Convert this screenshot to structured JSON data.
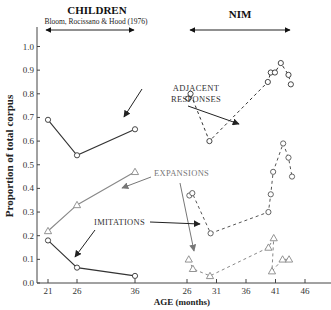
{
  "chart_data": {
    "type": "line",
    "title": "",
    "xlabel": "AGE (months)",
    "ylabel": "Proportion of total corpus",
    "ylim": [
      0.0,
      1.05
    ],
    "y_ticks": [
      "0.0",
      "0.1",
      "0.2",
      "0.3",
      "0.4",
      "0.5",
      "0.6",
      "0.7",
      "0.8",
      "0.9",
      "1.0"
    ],
    "grid": false,
    "groups": [
      {
        "name": "CHILDREN",
        "subtitle": "Bloom, Rocissano & Hood (1976)",
        "x_ticks": [
          "21",
          "26",
          "36"
        ],
        "line_style": "solid",
        "series": [
          {
            "name": "ADJACENT RESPONSES",
            "marker": "circle",
            "color": "#333333",
            "x": [
              21,
              26,
              36
            ],
            "values": [
              0.69,
              0.54,
              0.65
            ]
          },
          {
            "name": "EXPANSIONS",
            "marker": "triangle",
            "color": "#888888",
            "x": [
              21,
              26,
              36
            ],
            "values": [
              0.22,
              0.33,
              0.47
            ]
          },
          {
            "name": "IMITATIONS",
            "marker": "circle",
            "color": "#333333",
            "x": [
              21,
              26,
              36
            ],
            "values": [
              0.18,
              0.065,
              0.03
            ]
          }
        ]
      },
      {
        "name": "NIM",
        "x_ticks": [
          "26",
          "31",
          "36",
          "41",
          "46"
        ],
        "line_style": "dashed",
        "series": [
          {
            "name": "ADJACENT RESPONSES",
            "marker": "circle",
            "color": "#333333",
            "x": [
              26.2,
              26.6,
              29.8,
              39.7,
              40.2,
              40.9,
              41.9,
              43.2,
              43.6
            ],
            "values": [
              0.78,
              0.8,
              0.6,
              0.85,
              0.89,
              0.89,
              0.93,
              0.88,
              0.84
            ]
          },
          {
            "name": "EXPANSIONS",
            "marker": "circle",
            "color": "#555555",
            "x": [
              26.4,
              26.9,
              30.0,
              39.8,
              40.2,
              40.6,
              42.3,
              43.2,
              43.8
            ],
            "values": [
              0.37,
              0.38,
              0.21,
              0.3,
              0.375,
              0.47,
              0.59,
              0.53,
              0.45
            ]
          },
          {
            "name": "IMITATIONS",
            "marker": "triangle",
            "color": "#888888",
            "x": [
              26.3,
              27.0,
              29.9,
              39.8,
              40.7,
              40.4,
              42.2,
              43.3
            ],
            "values": [
              0.1,
              0.06,
              0.03,
              0.15,
              0.19,
              0.05,
              0.1,
              0.1
            ]
          }
        ]
      }
    ],
    "annotations": [
      "ADJACENT RESPONSES",
      "EXPANSIONS",
      "IMITATIONS"
    ]
  },
  "labels": {
    "children_title": "CHILDREN",
    "children_subtitle": "Bloom, Rocissano & Hood (1976)",
    "nim_title": "NIM",
    "y_axis_title": "Proportion of total corpus",
    "x_axis_title": "AGE (months)",
    "annot_adjacent_1": "ADJACENT",
    "annot_adjacent_2": "RESPONSES",
    "annot_expansions": "EXPANSIONS",
    "annot_imitations": "IMITATIONS"
  }
}
